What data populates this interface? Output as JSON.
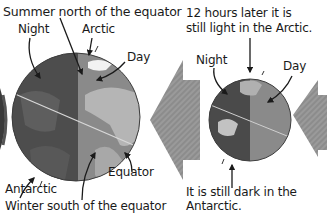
{
  "left_panel": {
    "title": "Summer north of the equator",
    "labels": {
      "night": "Night",
      "arctic": "Arctic",
      "day": "Day",
      "equator": "Equator",
      "antarctic": "Antarctic",
      "winter": "Winter south of the equator"
    }
  },
  "right_panel": {
    "caption_top_line1": "12 hours later it is",
    "caption_top_line2": "still light in the Arctic.",
    "labels": {
      "night": "Night",
      "day": "Day"
    },
    "caption_bottom_line1": "It is still dark in the",
    "caption_bottom_line2": "Antarctic."
  },
  "colors": {
    "night_side": "#4a4a4a",
    "day_side": "#8a8a8a",
    "land_day": "#b5b5b5",
    "land_night": "#5e5e5e",
    "sun_arrow": "#8f8f8f",
    "text": "#1a1a1a"
  }
}
